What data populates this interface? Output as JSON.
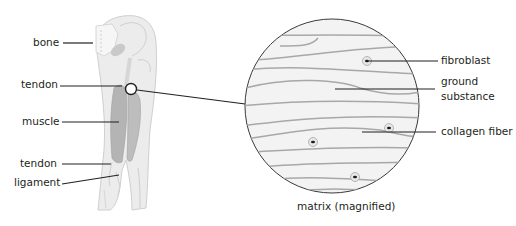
{
  "leg_labels": {
    "bone": "bone",
    "tendon_upper": "tendon",
    "muscle": "muscle",
    "tendon_lower": "tendon",
    "ligament": "ligament"
  },
  "matrix_labels": {
    "fibroblast": "fibroblast",
    "ground_substance_line1": "ground",
    "ground_substance_line2": "substance",
    "collagen_fiber": "collagen fiber"
  },
  "caption": "matrix (magnified)",
  "colors": {
    "line": "#231f20",
    "leg_fill": "#ebebeb",
    "leg_outline": "#c8c8c8",
    "muscle_fill": "#b4b4b4",
    "circle_fill": "#f2f2f2",
    "fiber": "#a6a6a6",
    "cell_ring": "#c9c9c9",
    "nucleus": "#1a1a1a"
  }
}
